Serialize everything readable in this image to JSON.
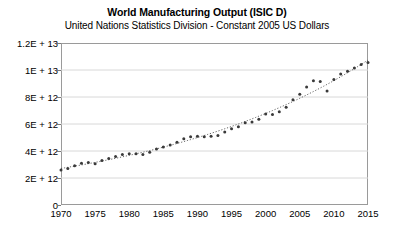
{
  "chart_data": {
    "type": "scatter",
    "title": "World Manufacturing Output (ISIC D)",
    "subtitle": "United Nations Statistics Division - Constant 2005 US Dollars",
    "xlabel": "",
    "ylabel": "",
    "grid": true,
    "legend": false,
    "xlim": [
      1970,
      2015
    ],
    "ylim": [
      0,
      12000000000000
    ],
    "xticks": [
      1970,
      1975,
      1980,
      1985,
      1990,
      1995,
      2000,
      2005,
      2010,
      2015
    ],
    "xticklabels": [
      "1970",
      "1975",
      "1980",
      "1985",
      "1990",
      "1995",
      "2000",
      "2005",
      "2010",
      "2015"
    ],
    "yticks": [
      0,
      2000000000000,
      4000000000000,
      6000000000000,
      8000000000000,
      10000000000000,
      12000000000000
    ],
    "yticklabels": [
      "0",
      "2E + 12",
      "4E + 12",
      "6E + 12",
      "8E + 12",
      "1E + 13",
      "1.2E + 13"
    ],
    "marker_color": "#3a3a3a",
    "trendline_color": "#555555",
    "trendline_style": "dotted",
    "series": [
      {
        "name": "World Manufacturing Output",
        "x": [
          1970,
          1971,
          1972,
          1973,
          1974,
          1975,
          1976,
          1977,
          1978,
          1979,
          1980,
          1981,
          1982,
          1983,
          1984,
          1985,
          1986,
          1987,
          1988,
          1989,
          1990,
          1991,
          1992,
          1993,
          1994,
          1995,
          1996,
          1997,
          1998,
          1999,
          2000,
          2001,
          2002,
          2003,
          2004,
          2005,
          2006,
          2007,
          2008,
          2009,
          2010,
          2011,
          2012,
          2013,
          2014,
          2015
        ],
        "values": [
          2600000000000,
          2700000000000,
          2900000000000,
          3100000000000,
          3150000000000,
          3050000000000,
          3300000000000,
          3450000000000,
          3600000000000,
          3750000000000,
          3800000000000,
          3800000000000,
          3750000000000,
          3900000000000,
          4150000000000,
          4300000000000,
          4450000000000,
          4650000000000,
          4900000000000,
          5050000000000,
          5100000000000,
          5050000000000,
          5100000000000,
          5150000000000,
          5400000000000,
          5650000000000,
          5800000000000,
          6100000000000,
          6150000000000,
          6350000000000,
          6750000000000,
          6700000000000,
          6900000000000,
          7250000000000,
          7800000000000,
          8200000000000,
          8750000000000,
          9200000000000,
          9150000000000,
          8450000000000,
          9300000000000,
          9700000000000,
          9900000000000,
          10150000000000,
          10400000000000,
          10550000000000
        ]
      }
    ]
  }
}
